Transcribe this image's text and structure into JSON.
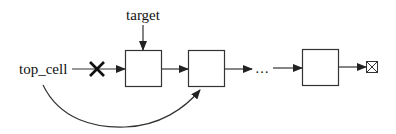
{
  "diagram": {
    "type": "linked-list",
    "labels": {
      "target": "target",
      "top_cell": "top_cell",
      "ellipsis": "…"
    },
    "nodes": [
      {
        "id": "node-1",
        "label": ""
      },
      {
        "id": "node-2",
        "label": ""
      },
      {
        "id": "node-3",
        "label": ""
      }
    ],
    "terminator": "null-terminator (crossed box)",
    "edges": [
      {
        "from": "target",
        "to": "node-1",
        "style": "arrow"
      },
      {
        "from": "top_cell",
        "to": "node-1",
        "style": "arrow",
        "removed": true,
        "mark": "X"
      },
      {
        "from": "node-1",
        "to": "node-2",
        "style": "arrow"
      },
      {
        "from": "node-2",
        "to": "ellipsis",
        "style": "arrow"
      },
      {
        "from": "ellipsis",
        "to": "node-3",
        "style": "arrow"
      },
      {
        "from": "node-3",
        "to": "terminator",
        "style": "arrow"
      },
      {
        "from": "top_cell",
        "to": "node-2",
        "style": "curved-arrow"
      }
    ],
    "colors": {
      "stroke": "#333333",
      "text": "#111111",
      "background": "#ffffff"
    }
  }
}
